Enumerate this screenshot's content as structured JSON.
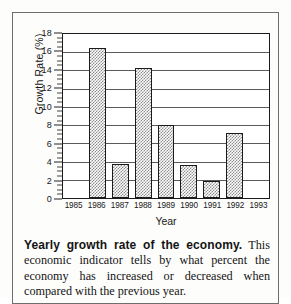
{
  "figure": {
    "caption_lead": "Yearly growth rate of the economy.",
    "caption_body": " This economic indicator tells by what percent the economy has increased or decreased when compared with the previous year."
  },
  "chart_data": {
    "type": "bar",
    "title": "",
    "xlabel": "Year",
    "ylabel": "Growth Rate (%)",
    "categories": [
      "1985",
      "1986",
      "1987",
      "1988",
      "1989",
      "1990",
      "1991",
      "1992",
      "1993"
    ],
    "values": [
      null,
      16.3,
      3.7,
      14.1,
      7.9,
      3.6,
      1.8,
      7.1,
      null
    ],
    "ylim": [
      0,
      18
    ],
    "ytick_values": [
      0,
      2,
      4,
      6,
      8,
      10,
      12,
      14,
      16,
      18
    ],
    "ytick_labels": [
      "0",
      "2",
      "4",
      "6",
      "8",
      "10",
      "12",
      "14",
      "16",
      "18"
    ],
    "minor_tick_step": 0.5,
    "grid": true,
    "grid_axis": "y",
    "legend": false,
    "bar_fill": "#8c8c8c",
    "bar_pattern": "dither-checkerboard",
    "bar_edge_color": "#1b1b1b",
    "frame_color": "#1b1b1b"
  }
}
